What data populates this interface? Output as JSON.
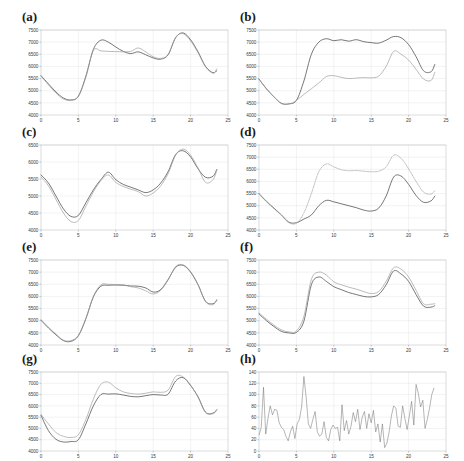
{
  "figure": {
    "title": "",
    "panel_count": 8,
    "layout": "4 rows x 2 columns",
    "background": "#ffffff"
  },
  "colors": {
    "series_actual": "#4a4a4a",
    "series_predicted": "#9d9d9d",
    "series_alt": "#a5a5a5",
    "frame": "#b9b9b9",
    "grid": "#dcdcdc",
    "tick_text": "#3a3a3a"
  },
  "labels": {
    "a": "(a)",
    "b": "(b)",
    "c": "(c)",
    "d": "(d)",
    "e": "(e)",
    "f": "(f)",
    "g": "(g)",
    "h": "(h)"
  },
  "chart_data": [
    {
      "id": "a",
      "type": "line",
      "title": "(a)",
      "xlabel": "",
      "ylabel": "",
      "xlim": [
        0,
        25
      ],
      "ylim": [
        4000,
        7500
      ],
      "xticks": [
        0,
        5,
        10,
        15,
        20,
        25
      ],
      "yticks": [
        4000,
        4500,
        5000,
        5500,
        6000,
        6500,
        7000,
        7500
      ],
      "grid": true,
      "legend": "none",
      "x": [
        0,
        1,
        2,
        3,
        4,
        5,
        6,
        7,
        8,
        9,
        10,
        11,
        12,
        13,
        14,
        15,
        16,
        17,
        18,
        19,
        20,
        21,
        22,
        23,
        23.5
      ],
      "series": [
        {
          "name": "actual",
          "style": "solid",
          "color": "#4a4a4a",
          "values": [
            5620,
            5280,
            4950,
            4700,
            4620,
            4780,
            5600,
            6700,
            7080,
            7000,
            6800,
            6620,
            6530,
            6600,
            6480,
            6350,
            6300,
            6480,
            7180,
            7380,
            7100,
            6600,
            6000,
            5740,
            5830
          ]
        },
        {
          "name": "predicted",
          "style": "gray",
          "color": "#9d9d9d",
          "values": [
            5600,
            5240,
            4900,
            4660,
            4600,
            4760,
            5560,
            6660,
            6640,
            6620,
            6610,
            6600,
            6620,
            6760,
            6600,
            6400,
            6330,
            6500,
            7200,
            7350,
            7050,
            6560,
            5980,
            5720,
            5900
          ]
        }
      ]
    },
    {
      "id": "b",
      "type": "line",
      "title": "(b)",
      "xlabel": "",
      "ylabel": "",
      "xlim": [
        0,
        25
      ],
      "ylim": [
        4000,
        7500
      ],
      "xticks": [
        0,
        5,
        10,
        15,
        20,
        25
      ],
      "yticks": [
        4000,
        4500,
        5000,
        5500,
        6000,
        6500,
        7000,
        7500
      ],
      "grid": true,
      "legend": "none",
      "x": [
        0,
        1,
        2,
        3,
        4,
        5,
        6,
        7,
        8,
        9,
        10,
        11,
        12,
        13,
        14,
        15,
        16,
        17,
        18,
        19,
        20,
        21,
        22,
        23,
        23.5
      ],
      "series": [
        {
          "name": "actual",
          "style": "solid",
          "color": "#4a4a4a",
          "values": [
            5480,
            5080,
            4750,
            4480,
            4460,
            4600,
            5400,
            6500,
            7000,
            7140,
            7060,
            7100,
            7040,
            7100,
            7020,
            6980,
            6960,
            7080,
            7230,
            7180,
            6900,
            6400,
            5820,
            5780,
            6080
          ]
        },
        {
          "name": "predicted",
          "style": "gray",
          "color": "#9d9d9d",
          "values": [
            5470,
            5070,
            4740,
            4470,
            4450,
            4600,
            4850,
            5080,
            5320,
            5580,
            5620,
            5550,
            5500,
            5520,
            5540,
            5530,
            5600,
            6000,
            6620,
            6500,
            6260,
            5880,
            5480,
            5420,
            5760
          ]
        }
      ]
    },
    {
      "id": "c",
      "type": "line",
      "title": "(c)",
      "xlabel": "",
      "ylabel": "",
      "xlim": [
        0,
        25
      ],
      "ylim": [
        4000,
        6500
      ],
      "xticks": [
        0,
        5,
        10,
        15,
        20,
        25
      ],
      "yticks": [
        4000,
        4500,
        5000,
        5500,
        6000,
        6500
      ],
      "grid": true,
      "legend": "none",
      "x": [
        0,
        1,
        2,
        3,
        4,
        5,
        6,
        7,
        8,
        9,
        10,
        11,
        12,
        13,
        14,
        15,
        16,
        17,
        18,
        19,
        20,
        21,
        22,
        23,
        23.5
      ],
      "series": [
        {
          "name": "actual",
          "style": "solid",
          "color": "#4a4a4a",
          "values": [
            5620,
            5380,
            5000,
            4620,
            4400,
            4430,
            4800,
            5180,
            5480,
            5700,
            5480,
            5340,
            5260,
            5180,
            5100,
            5180,
            5380,
            5720,
            6220,
            6330,
            6150,
            5800,
            5550,
            5580,
            5780
          ]
        },
        {
          "name": "predicted",
          "style": "gray",
          "color": "#9d9d9d",
          "values": [
            5560,
            5300,
            4900,
            4500,
            4250,
            4280,
            4700,
            5120,
            5450,
            5620,
            5400,
            5280,
            5200,
            5130,
            5000,
            5090,
            5300,
            5660,
            6200,
            6380,
            6200,
            5820,
            5400,
            5480,
            5760
          ]
        }
      ]
    },
    {
      "id": "d",
      "type": "line",
      "title": "(d)",
      "xlabel": "",
      "ylabel": "",
      "xlim": [
        0,
        25
      ],
      "ylim": [
        4000,
        7500
      ],
      "xticks": [
        0,
        5,
        10,
        15,
        20,
        25
      ],
      "yticks": [
        4000,
        4500,
        5000,
        5500,
        6000,
        6500,
        7000,
        7500
      ],
      "grid": true,
      "legend": "none",
      "x": [
        0,
        1,
        2,
        3,
        4,
        5,
        6,
        7,
        8,
        9,
        10,
        11,
        12,
        13,
        14,
        15,
        16,
        17,
        18,
        19,
        20,
        21,
        22,
        23,
        23.5
      ],
      "series": [
        {
          "name": "actual",
          "style": "solid",
          "color": "#4a4a4a",
          "values": [
            5500,
            5180,
            4900,
            4620,
            4320,
            4300,
            4450,
            4620,
            5000,
            5220,
            5160,
            5080,
            5000,
            4920,
            4820,
            4780,
            4900,
            5400,
            6180,
            6220,
            5880,
            5420,
            5140,
            5200,
            5400
          ]
        },
        {
          "name": "predicted",
          "style": "dashed",
          "color": "#a5a5a5",
          "values": [
            5480,
            5160,
            4880,
            4600,
            4300,
            4280,
            4700,
            5500,
            6400,
            6720,
            6600,
            6480,
            6440,
            6450,
            6420,
            6400,
            6420,
            6600,
            7080,
            6950,
            6520,
            6000,
            5560,
            5480,
            5620
          ]
        }
      ]
    },
    {
      "id": "e",
      "type": "line",
      "title": "(e)",
      "xlabel": "",
      "ylabel": "",
      "xlim": [
        0,
        25
      ],
      "ylim": [
        4000,
        7500
      ],
      "xticks": [
        0,
        5,
        10,
        15,
        20,
        25
      ],
      "yticks": [
        4000,
        4500,
        5000,
        5500,
        6000,
        6500,
        7000,
        7500
      ],
      "grid": true,
      "legend": "none",
      "x": [
        0,
        1,
        2,
        3,
        4,
        5,
        6,
        7,
        8,
        9,
        10,
        11,
        12,
        13,
        14,
        15,
        16,
        17,
        18,
        19,
        20,
        21,
        22,
        23,
        23.5
      ],
      "series": [
        {
          "name": "actual",
          "style": "solid",
          "color": "#4a4a4a",
          "values": [
            5020,
            4700,
            4420,
            4180,
            4150,
            4380,
            5080,
            5980,
            6420,
            6460,
            6470,
            6460,
            6430,
            6420,
            6350,
            6180,
            6280,
            6700,
            7200,
            7280,
            7000,
            6480,
            5800,
            5700,
            5840
          ]
        },
        {
          "name": "predicted",
          "style": "gray",
          "color": "#9d9d9d",
          "values": [
            5050,
            4730,
            4450,
            4200,
            4180,
            4400,
            5100,
            6000,
            6480,
            6500,
            6490,
            6480,
            6400,
            6350,
            6230,
            6100,
            6250,
            6680,
            7230,
            7300,
            7020,
            6480,
            5780,
            5660,
            5880
          ]
        }
      ]
    },
    {
      "id": "f",
      "type": "line",
      "title": "(f)",
      "xlabel": "",
      "ylabel": "",
      "xlim": [
        0,
        25
      ],
      "ylim": [
        4000,
        7500
      ],
      "xticks": [
        0,
        5,
        10,
        15,
        20,
        25
      ],
      "yticks": [
        4000,
        4500,
        5000,
        5500,
        6000,
        6500,
        7000,
        7500
      ],
      "grid": true,
      "legend": "none",
      "x": [
        0,
        1,
        2,
        3,
        4,
        5,
        6,
        7,
        8,
        9,
        10,
        11,
        12,
        13,
        14,
        15,
        16,
        17,
        18,
        19,
        20,
        21,
        22,
        23,
        23.5
      ],
      "series": [
        {
          "name": "actual",
          "style": "solid",
          "color": "#4a4a4a",
          "values": [
            5280,
            5000,
            4760,
            4560,
            4500,
            4520,
            4980,
            6480,
            6800,
            6620,
            6400,
            6280,
            6160,
            6080,
            6000,
            5980,
            6080,
            6480,
            7050,
            6920,
            6620,
            6080,
            5600,
            5560,
            5620
          ]
        },
        {
          "name": "predicted",
          "style": "gray",
          "color": "#9d9d9d",
          "values": [
            5320,
            5060,
            4820,
            4620,
            4540,
            4580,
            5180,
            6700,
            7000,
            6880,
            6600,
            6480,
            6380,
            6300,
            6200,
            6120,
            6200,
            6620,
            7180,
            7120,
            6800,
            6250,
            5700,
            5680,
            5700
          ]
        }
      ]
    },
    {
      "id": "g",
      "type": "line",
      "title": "(g)",
      "xlabel": "",
      "ylabel": "",
      "xlim": [
        0,
        25
      ],
      "ylim": [
        4000,
        7500
      ],
      "xticks": [
        0,
        5,
        10,
        15,
        20,
        25
      ],
      "yticks": [
        4000,
        4500,
        5000,
        5500,
        6000,
        6500,
        7000,
        7500
      ],
      "grid": true,
      "legend": "none",
      "x": [
        0,
        1,
        2,
        3,
        4,
        5,
        6,
        7,
        8,
        9,
        10,
        11,
        12,
        13,
        14,
        15,
        16,
        17,
        18,
        19,
        20,
        21,
        22,
        23,
        23.5
      ],
      "series": [
        {
          "name": "actual",
          "style": "solid",
          "color": "#4a4a4a",
          "values": [
            5580,
            4900,
            4520,
            4400,
            4420,
            4500,
            5200,
            6000,
            6500,
            6520,
            6530,
            6480,
            6420,
            6400,
            6450,
            6500,
            6480,
            6520,
            7100,
            7250,
            6900,
            6400,
            5720,
            5680,
            5830
          ]
        },
        {
          "name": "predicted",
          "style": "gray",
          "color": "#9d9d9d",
          "values": [
            5620,
            5200,
            4820,
            4650,
            4600,
            4720,
            5400,
            6300,
            6950,
            7050,
            6800,
            6620,
            6550,
            6520,
            6560,
            6620,
            6600,
            6700,
            7300,
            7280,
            6920,
            6380,
            5700,
            5650,
            5820
          ]
        }
      ]
    },
    {
      "id": "h",
      "type": "line",
      "title": "(h)",
      "xlabel": "",
      "ylabel": "",
      "xlim": [
        0,
        25
      ],
      "ylim": [
        0,
        140
      ],
      "xticks": [
        0,
        5,
        10,
        15,
        20,
        25
      ],
      "yticks": [
        0,
        20,
        40,
        60,
        80,
        100,
        120,
        140
      ],
      "grid": true,
      "legend": "none",
      "x": [
        0,
        0.3,
        0.6,
        0.9,
        1.2,
        1.5,
        1.8,
        2.1,
        2.4,
        2.7,
        3.0,
        3.3,
        3.6,
        3.9,
        4.2,
        4.5,
        4.8,
        5.1,
        5.4,
        5.7,
        6.0,
        6.3,
        6.6,
        6.9,
        7.2,
        7.5,
        7.8,
        8.1,
        8.4,
        8.7,
        9.0,
        9.3,
        9.6,
        9.9,
        10.2,
        10.5,
        10.8,
        11.1,
        11.4,
        11.7,
        12.0,
        12.3,
        12.6,
        12.9,
        13.2,
        13.5,
        13.8,
        14.1,
        14.4,
        14.7,
        15.0,
        15.3,
        15.6,
        15.9,
        16.2,
        16.5,
        16.8,
        17.1,
        17.4,
        17.7,
        18.0,
        18.3,
        18.6,
        18.9,
        19.2,
        19.5,
        19.8,
        20.1,
        20.4,
        20.7,
        21.0,
        21.3,
        21.6,
        21.9,
        22.2,
        22.5,
        22.8,
        23.1,
        23.4
      ],
      "series": [
        {
          "name": "error",
          "style": "noise",
          "color": "#6d6d6d",
          "values": [
            28,
            42,
            113,
            30,
            58,
            80,
            64,
            74,
            72,
            50,
            42,
            38,
            26,
            18,
            34,
            44,
            22,
            48,
            56,
            78,
            132,
            96,
            48,
            40,
            56,
            70,
            34,
            26,
            30,
            52,
            24,
            18,
            38,
            46,
            40,
            42,
            18,
            82,
            36,
            54,
            30,
            44,
            68,
            52,
            74,
            38,
            60,
            70,
            40,
            66,
            50,
            72,
            34,
            48,
            16,
            48,
            6,
            14,
            34,
            62,
            80,
            76,
            44,
            42,
            80,
            58,
            38,
            62,
            88,
            46,
            118,
            102,
            78,
            90,
            40,
            56,
            76,
            100,
            112
          ]
        }
      ]
    }
  ]
}
